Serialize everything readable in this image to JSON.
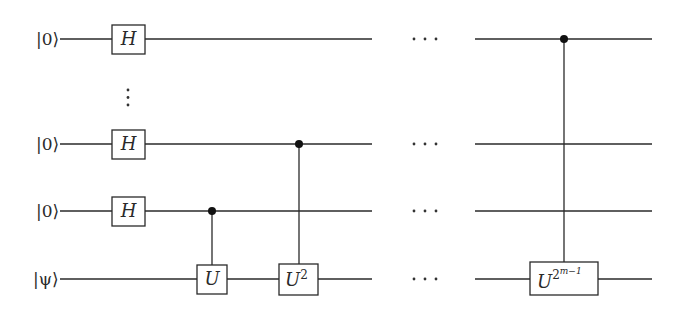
{
  "diagram": {
    "type": "quantum-circuit",
    "colors": {
      "ink": "#2a2a2a",
      "background": "#ffffff"
    },
    "qubits": [
      {
        "id": "q0",
        "label": "|0⟩",
        "y": 39,
        "gate": "H"
      },
      {
        "id": "q1",
        "label": "|0⟩",
        "y": 144,
        "gate": "H"
      },
      {
        "id": "q2",
        "label": "|0⟩",
        "y": 211,
        "gate": "H"
      },
      {
        "id": "q3",
        "label": "|ψ⟩",
        "y": 279,
        "gate": null
      }
    ],
    "vertical_ellipsis": "⋮",
    "horizontal_ellipsis": "···",
    "hadamard_label": "H",
    "controlled_gates": [
      {
        "control": "q2",
        "target": "q3",
        "base": "U",
        "exponent": "",
        "exponent_sup": ""
      },
      {
        "control": "q1",
        "target": "q3",
        "base": "U",
        "exponent": "2",
        "exponent_sup": ""
      },
      {
        "control": "q0",
        "target": "q3",
        "base": "U",
        "exponent": "2",
        "exponent_sup": "m−1"
      }
    ]
  }
}
